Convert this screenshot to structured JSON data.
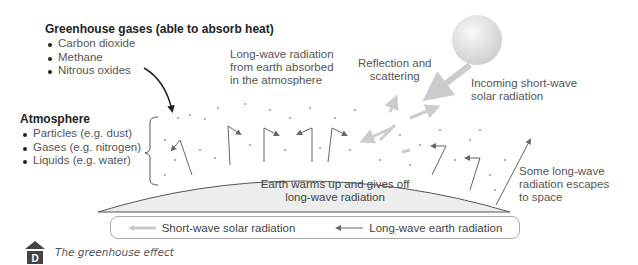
{
  "greenhouse_gases": {
    "heading": "Greenhouse gases (able to absorb heat)",
    "items": [
      "Carbon dioxide",
      "Methane",
      "Nitrous oxides"
    ]
  },
  "atmosphere": {
    "heading": "Atmosphere",
    "items": [
      "Particles (e.g. dust)",
      "Gases (e.g. nitrogen)",
      "Liquids (e.g. water)"
    ]
  },
  "labels": {
    "long_wave_absorbed": [
      "Long-wave radiation",
      "from earth absorbed",
      "in the atmosphere"
    ],
    "reflection": [
      "Reflection and",
      "scattering"
    ],
    "incoming": [
      "Incoming short-wave",
      "solar radiation"
    ],
    "earth": [
      "Earth warms up and gives off",
      "long-wave radiation"
    ],
    "escapes": [
      "Some long-wave",
      "radiation escapes",
      "to space"
    ]
  },
  "legend": {
    "short_wave": "Short-wave solar radiation",
    "long_wave": "Long-wave earth radiation",
    "short_wave_color": "#c8c8c8",
    "long_wave_color": "#666666"
  },
  "caption": "The greenhouse effect",
  "icons": {
    "logo": "house-d-icon",
    "sun": "sun-icon"
  }
}
